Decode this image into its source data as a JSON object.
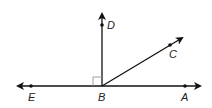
{
  "diagram": {
    "type": "geometry-rays",
    "labels": {
      "D": "D",
      "C": "C",
      "E": "E",
      "B": "B",
      "A": "A"
    },
    "points": {
      "B": [
        102,
        86
      ],
      "D": [
        102,
        25
      ],
      "C": [
        170,
        45
      ],
      "E": [
        31,
        86
      ],
      "A": [
        185,
        86
      ]
    },
    "right_angle_marker": "at B between BE and BD",
    "colors": {
      "stroke": "#111111",
      "background": "#ffffff"
    }
  }
}
